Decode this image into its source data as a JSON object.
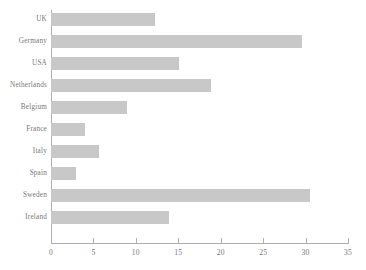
{
  "chart_data": {
    "type": "bar",
    "orientation": "horizontal",
    "title": "",
    "xlabel": "",
    "ylabel": "",
    "categories": [
      "UK",
      "Germany",
      "USA",
      "Netherlands",
      "Belgium",
      "France",
      "Italy",
      "Spain",
      "Sweden",
      "Ireland"
    ],
    "values": [
      12.3,
      29.6,
      15.1,
      18.9,
      9.0,
      4.0,
      5.7,
      2.9,
      30.5,
      13.9
    ],
    "xlim": [
      0,
      35
    ],
    "xticks": [
      0,
      5,
      10,
      15,
      20,
      25,
      30,
      35
    ],
    "xtick_labels": [
      "0",
      "5",
      "10",
      "15",
      "20",
      "25",
      "30",
      "35"
    ],
    "grid": false,
    "legend": null,
    "bar_color": "#c8c8c8",
    "axis_color": "#b0b0b0",
    "text_color": "#777777"
  }
}
